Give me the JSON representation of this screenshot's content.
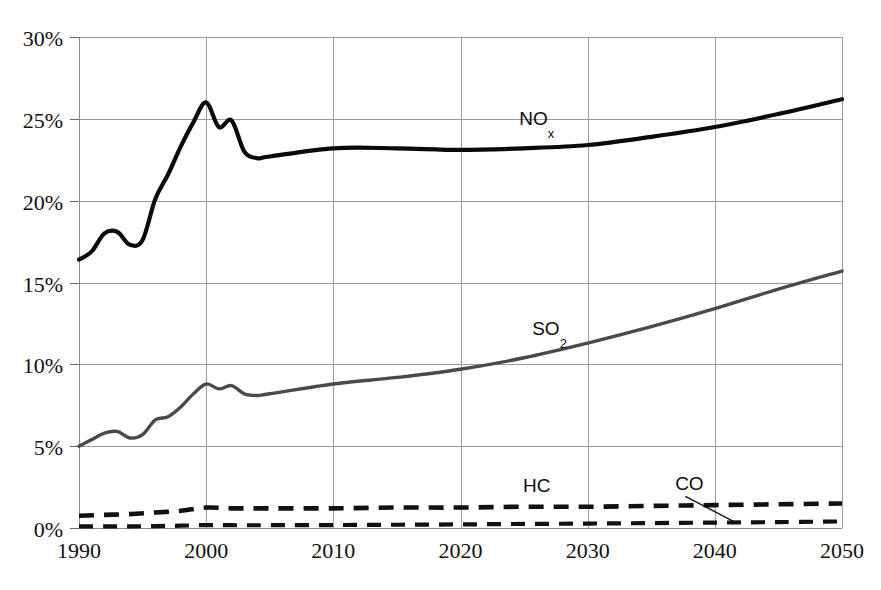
{
  "chart_data": {
    "type": "line",
    "title": "",
    "subtitle": "",
    "xlabel": "",
    "ylabel": "",
    "xlim": [
      1990,
      2050
    ],
    "ylim": [
      0,
      30
    ],
    "grid": true,
    "legend_position": "inline-annotations",
    "y_ticks": [
      "0%",
      "5%",
      "10%",
      "15%",
      "20%",
      "25%",
      "30%"
    ],
    "y_tick_values": [
      0,
      5,
      10,
      15,
      20,
      25,
      30
    ],
    "x_ticks": [
      "1990",
      "2000",
      "2010",
      "2020",
      "2030",
      "2040",
      "2050"
    ],
    "x_tick_values": [
      1990,
      2000,
      2010,
      2020,
      2030,
      2040,
      2050
    ],
    "annotations": [
      {
        "text": "NO",
        "sub": "x",
        "x": 2026,
        "y": 24.6
      },
      {
        "text": "SO",
        "sub": "2",
        "x": 2027,
        "y": 11.8
      },
      {
        "text": "HC",
        "sub": "",
        "x": 2026,
        "y": 2.2
      },
      {
        "text": "CO",
        "sub": "",
        "x": 2038,
        "y": 2.3
      }
    ],
    "series": [
      {
        "name": "NOx",
        "style": "solid",
        "color": "#0a0a0a",
        "x": [
          1990,
          1991,
          1992,
          1993,
          1994,
          1995,
          1996,
          1997,
          1998,
          1999,
          2000,
          2001,
          2002,
          2003,
          2004,
          2005,
          2010,
          2015,
          2020,
          2025,
          2030,
          2035,
          2040,
          2045,
          2050
        ],
        "values": [
          16.4,
          16.9,
          18.0,
          18.1,
          17.3,
          17.6,
          20.1,
          21.6,
          23.3,
          24.8,
          26.0,
          24.5,
          24.9,
          23.0,
          22.6,
          22.7,
          23.2,
          23.2,
          23.1,
          23.2,
          23.4,
          23.9,
          24.5,
          25.3,
          26.2
        ]
      },
      {
        "name": "SO2",
        "style": "solid",
        "color": "#4a4a4a",
        "x": [
          1990,
          1991,
          1992,
          1993,
          1994,
          1995,
          1996,
          1997,
          1998,
          1999,
          2000,
          2001,
          2002,
          2003,
          2004,
          2005,
          2010,
          2015,
          2020,
          2025,
          2030,
          2035,
          2040,
          2045,
          2050
        ],
        "values": [
          5.0,
          5.4,
          5.8,
          5.9,
          5.5,
          5.7,
          6.6,
          6.8,
          7.4,
          8.2,
          8.8,
          8.5,
          8.7,
          8.2,
          8.1,
          8.2,
          8.8,
          9.2,
          9.7,
          10.4,
          11.3,
          12.3,
          13.4,
          14.6,
          15.7
        ]
      },
      {
        "name": "HC",
        "style": "dashed",
        "color": "#111111",
        "x": [
          1990,
          1992,
          1994,
          1996,
          1998,
          2000,
          2002,
          2005,
          2010,
          2015,
          2020,
          2025,
          2030,
          2035,
          2040,
          2045,
          2050
        ],
        "values": [
          0.75,
          0.8,
          0.85,
          0.95,
          1.05,
          1.25,
          1.2,
          1.2,
          1.2,
          1.25,
          1.25,
          1.3,
          1.3,
          1.35,
          1.4,
          1.45,
          1.5
        ]
      },
      {
        "name": "CO",
        "style": "dashed",
        "color": "#111111",
        "x": [
          1990,
          1992,
          1994,
          1996,
          1998,
          2000,
          2002,
          2005,
          2010,
          2015,
          2020,
          2025,
          2030,
          2035,
          2040,
          2045,
          2050
        ],
        "values": [
          0.1,
          0.1,
          0.1,
          0.12,
          0.14,
          0.18,
          0.17,
          0.17,
          0.18,
          0.2,
          0.22,
          0.25,
          0.27,
          0.3,
          0.33,
          0.36,
          0.4
        ]
      }
    ]
  },
  "plot": {
    "left": 79,
    "right": 842,
    "top": 37,
    "bottom": 528
  }
}
